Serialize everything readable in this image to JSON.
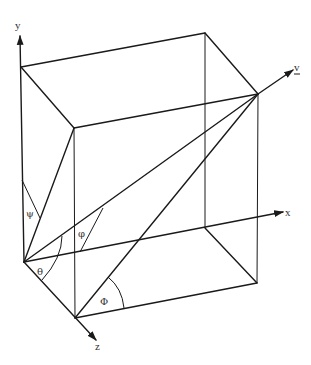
{
  "diagram": {
    "type": "3d-box-vector-angles",
    "axes": {
      "x": {
        "label": "x"
      },
      "y": {
        "label": "y"
      },
      "z": {
        "label": "z"
      }
    },
    "vector": {
      "label": "v",
      "underline": true
    },
    "angles": [
      {
        "symbol": "ψ",
        "name": "psi"
      },
      {
        "symbol": "φ",
        "name": "phi-lower"
      },
      {
        "symbol": "θ",
        "name": "theta"
      },
      {
        "symbol": "Φ",
        "name": "phi-upper"
      }
    ],
    "colors": {
      "line": "#1a1a1a",
      "text": "#333333",
      "background": "#ffffff"
    }
  }
}
